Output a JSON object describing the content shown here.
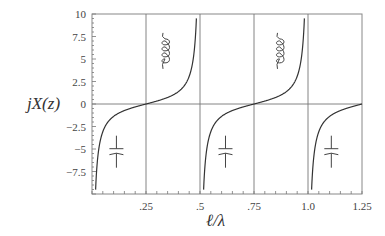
{
  "chart_data": {
    "type": "line",
    "title": "",
    "xlabel": "ℓ/λ",
    "ylabel": "jX(z)",
    "xlim": [
      0,
      1.25
    ],
    "ylim": [
      -10,
      10
    ],
    "grid": true,
    "legend": null,
    "x_ticks": [
      {
        "value": 0.25,
        "label": ".25"
      },
      {
        "value": 0.5,
        "label": ".5"
      },
      {
        "value": 0.75,
        "label": ".75"
      },
      {
        "value": 1.0,
        "label": "1.0"
      },
      {
        "value": 1.25,
        "label": "1.25"
      }
    ],
    "y_ticks": [
      {
        "value": 10,
        "label": "10"
      },
      {
        "value": 7.5,
        "label": "7.5"
      },
      {
        "value": 5,
        "label": "5"
      },
      {
        "value": 2.5,
        "label": "2.5"
      },
      {
        "value": 0,
        "label": "0"
      },
      {
        "value": -2.5,
        "label": "−2.5"
      },
      {
        "value": -5,
        "label": "−5"
      },
      {
        "value": -7.5,
        "label": "−7.5"
      }
    ],
    "gridlines_x": [
      0.25,
      0.5,
      0.75,
      1.0
    ],
    "gridlines_y": [
      0
    ],
    "series": [
      {
        "name": "jX(z) = tan(2π ℓ/λ) (shorted stub reactance, shown with -cot form)",
        "function": "-cot(2*pi*x)",
        "poles": [
          0,
          0.5,
          1.0
        ],
        "zeros": [
          0.25,
          0.75,
          1.25
        ],
        "sample_points": [
          {
            "x": 0.01,
            "y": -10
          },
          {
            "x": 0.05,
            "y": -3.08
          },
          {
            "x": 0.1,
            "y": -1.38
          },
          {
            "x": 0.15,
            "y": -0.73
          },
          {
            "x": 0.2,
            "y": -0.32
          },
          {
            "x": 0.25,
            "y": 0
          },
          {
            "x": 0.3,
            "y": 0.32
          },
          {
            "x": 0.35,
            "y": 0.73
          },
          {
            "x": 0.4,
            "y": 1.38
          },
          {
            "x": 0.45,
            "y": 3.08
          },
          {
            "x": 0.49,
            "y": 10
          },
          {
            "x": 0.51,
            "y": -10
          },
          {
            "x": 0.75,
            "y": 0
          },
          {
            "x": 0.99,
            "y": 10
          },
          {
            "x": 1.01,
            "y": -10
          },
          {
            "x": 1.25,
            "y": 0
          }
        ]
      }
    ],
    "annotations": [
      {
        "type": "capacitor-symbol",
        "x": 0.113,
        "y": -5.3
      },
      {
        "type": "inductor-symbol",
        "x": 0.338,
        "y": 5.9
      },
      {
        "type": "capacitor-symbol",
        "x": 0.618,
        "y": -5.3
      },
      {
        "type": "inductor-symbol",
        "x": 0.868,
        "y": 5.9
      },
      {
        "type": "capacitor-symbol",
        "x": 1.108,
        "y": -5.3
      }
    ]
  },
  "colors": {
    "curve": "#333333",
    "frame": "#888888",
    "grid": "#777777"
  }
}
